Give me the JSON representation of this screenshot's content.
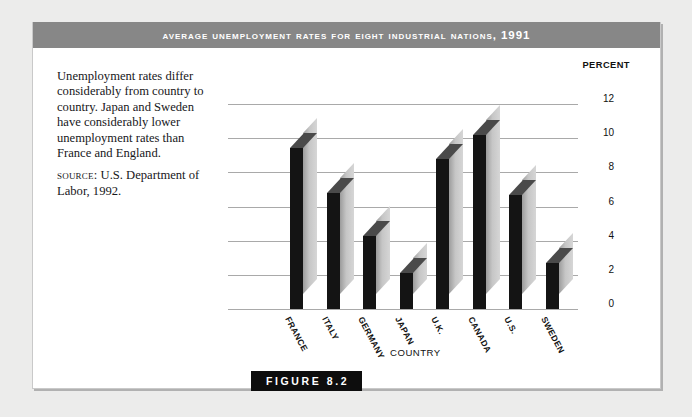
{
  "figure": {
    "title": "Average Unemployment Rates for Eight Industrial Nations, 1991",
    "badge": "FIGURE 8.2",
    "title_bar_color": "#878787",
    "badge_color": "#0d0d0d"
  },
  "caption": {
    "body": "Unemployment rates differ considerably from country to country. Japan and Sweden have considerably lower unemployment rates than France and England.",
    "source_label": "SOURCE:",
    "source_text": " U.S. Department of Labor, 1992."
  },
  "chart_data": {
    "type": "bar",
    "title": "Average Unemployment Rates for Eight Industrial Nations, 1991",
    "categories": [
      "FRANCE",
      "ITALY",
      "GERMANY",
      "JAPAN",
      "U.K.",
      "CANADA",
      "U.S.",
      "SWEDEN"
    ],
    "values": [
      9.4,
      6.8,
      4.3,
      2.1,
      8.8,
      10.2,
      6.7,
      2.7
    ],
    "xlabel": "COUNTRY",
    "ylabel": "PERCENT",
    "ylim": [
      0,
      12
    ],
    "yticks": [
      12,
      10,
      8,
      6,
      4,
      2,
      0
    ],
    "grid": true,
    "legend": "none",
    "style": "3d-bar",
    "bar_face_color": "#141414",
    "bar_side_color": "#c6c6c6",
    "bar_top_color": "#4a4a4a"
  }
}
